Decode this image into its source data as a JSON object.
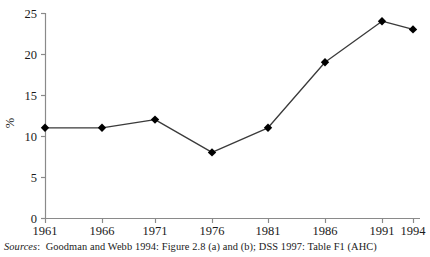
{
  "chart_data": {
    "type": "line",
    "title": "",
    "subtitle": "",
    "xlabel": "",
    "ylabel": "%",
    "categories": [
      "1961",
      "1966",
      "1971",
      "1976",
      "1981",
      "1986",
      "1991",
      "1994"
    ],
    "x": [
      1961,
      1966,
      1971,
      1976,
      1981,
      1986,
      1991,
      1994
    ],
    "values": [
      11,
      11,
      12,
      8,
      11,
      19,
      24,
      23
    ],
    "series": [
      {
        "name": "",
        "values": [
          11,
          11,
          12,
          8,
          11,
          19,
          24,
          23
        ]
      }
    ],
    "ylim": [
      0,
      25
    ],
    "yticks": [
      0,
      5,
      10,
      15,
      20,
      25
    ],
    "ytick_labels": [
      "0",
      "5",
      "10",
      "15",
      "20",
      "25"
    ],
    "xtick_labels": [
      "1961",
      "1966",
      "1971",
      "1976",
      "1981",
      "1986",
      "1991",
      "1994"
    ],
    "grid": false,
    "legend": "none",
    "marker": "diamond",
    "line_color": "#3a3a3a",
    "marker_color": "#000000",
    "axis_color": "#8a8a8a"
  },
  "source_note": {
    "label": "Sources",
    "separator": ":",
    "text": "Goodman and Webb 1994: Figure 2.8 (a) and (b); DSS 1997: Table F1 (AHC)"
  }
}
